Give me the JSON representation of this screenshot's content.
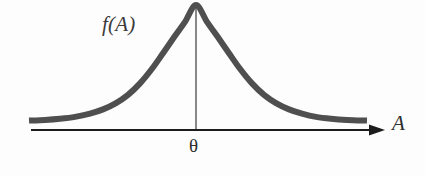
{
  "figure": {
    "type": "probability-density-curve",
    "background_color": "#fdfdfd",
    "curve_color": "#4f4f4f",
    "axis_color": "#1c1c1c",
    "labels": {
      "density": "f(A)",
      "x_axis": "A",
      "center": "θ"
    }
  },
  "chart_data": {
    "type": "line",
    "title": "",
    "subtitle": "",
    "xlabel": "A",
    "ylabel": "f(A)",
    "annotations": [
      {
        "text": "f(A)",
        "x": 103,
        "y": 28,
        "role": "curve-label"
      },
      {
        "text": "A",
        "x": 395,
        "y": 128,
        "role": "axis-label"
      },
      {
        "text": "θ",
        "x": 197,
        "y": 150,
        "role": "center-tick-label"
      }
    ],
    "grid": false,
    "legend": null,
    "xlim": [
      29,
      367
    ],
    "ylim": [
      0,
      1
    ],
    "center": 196,
    "peak_y_px": 5,
    "baseline_y_px": 130,
    "tail_y_px": 122,
    "stroke_width_px": 6,
    "vertical_line": {
      "x": 196,
      "y_top": 8,
      "y_bottom": 130
    },
    "x": [
      29,
      45,
      60,
      75,
      90,
      103,
      116,
      128,
      140,
      152,
      163,
      174,
      185,
      196,
      207,
      218,
      229,
      240,
      252,
      264,
      276,
      289,
      302,
      316,
      331,
      347,
      367
    ],
    "y": [
      0.012,
      0.018,
      0.028,
      0.044,
      0.072,
      0.108,
      0.162,
      0.232,
      0.33,
      0.455,
      0.588,
      0.724,
      0.856,
      1.0,
      0.856,
      0.724,
      0.588,
      0.455,
      0.33,
      0.232,
      0.162,
      0.108,
      0.072,
      0.044,
      0.028,
      0.018,
      0.012
    ],
    "series": [
      {
        "name": "f(A)",
        "values": [
          0.012,
          0.018,
          0.028,
          0.044,
          0.072,
          0.108,
          0.162,
          0.232,
          0.33,
          0.455,
          0.588,
          0.724,
          0.856,
          1.0,
          0.856,
          0.724,
          0.588,
          0.455,
          0.33,
          0.232,
          0.162,
          0.108,
          0.072,
          0.044,
          0.028,
          0.018,
          0.012
        ]
      }
    ]
  }
}
